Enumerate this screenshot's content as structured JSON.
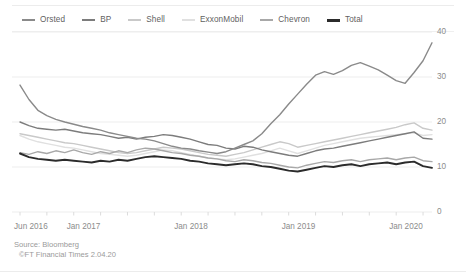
{
  "chart_data": {
    "type": "line",
    "title": "",
    "subtitle": "",
    "xlabel": "",
    "ylabel": "",
    "ylim": [
      0,
      40
    ],
    "yticks": [
      0,
      10,
      20,
      30,
      40
    ],
    "ytick_labels": [
      "0",
      "10",
      "20",
      "30",
      "40"
    ],
    "grid": true,
    "grid_axis": "y",
    "legend_position": "top-left",
    "x_start": "2016-06",
    "x_end": "2020-04",
    "x": [
      "Jun 2016",
      "Jul 2016",
      "Aug 2016",
      "Sep 2016",
      "Oct 2016",
      "Nov 2016",
      "Dec 2016",
      "Jan 2017",
      "Feb 2017",
      "Mar 2017",
      "Apr 2017",
      "May 2017",
      "Jun 2017",
      "Jul 2017",
      "Aug 2017",
      "Sep 2017",
      "Oct 2017",
      "Nov 2017",
      "Dec 2017",
      "Jan 2018",
      "Feb 2018",
      "Mar 2018",
      "Apr 2018",
      "May 2018",
      "Jun 2018",
      "Jul 2018",
      "Aug 2018",
      "Sep 2018",
      "Oct 2018",
      "Nov 2018",
      "Dec 2018",
      "Jan 2019",
      "Feb 2019",
      "Mar 2019",
      "Apr 2019",
      "May 2019",
      "Jun 2019",
      "Jul 2019",
      "Aug 2019",
      "Sep 2019",
      "Oct 2019",
      "Nov 2019",
      "Dec 2019",
      "Jan 2020",
      "Feb 2020",
      "Mar 2020",
      "Apr 2020"
    ],
    "xticks": [
      "Jun 2016",
      "Jan 2017",
      "Jan 2018",
      "Jan 2019",
      "Jan 2020"
    ],
    "xtick_labels": [
      "Jun 2016",
      "Jan 2017",
      "Jan 2018",
      "Jan 2019",
      "Jan 2020"
    ],
    "series": [
      {
        "name": "Orsted",
        "color": "#8a8a8a",
        "width": 1.4,
        "values": [
          28.2,
          25.0,
          22.6,
          21.4,
          20.6,
          20.0,
          19.5,
          19.0,
          18.6,
          18.2,
          17.6,
          17.2,
          16.8,
          16.4,
          16.2,
          15.8,
          15.2,
          14.6,
          14.2,
          14.0,
          13.6,
          13.3,
          13.0,
          13.4,
          14.2,
          15.0,
          15.8,
          17.4,
          19.6,
          21.6,
          24.0,
          26.2,
          28.4,
          30.4,
          31.2,
          30.6,
          31.4,
          32.6,
          33.2,
          32.4,
          31.6,
          30.4,
          29.2,
          28.6,
          31.0,
          33.6,
          37.6
        ]
      },
      {
        "name": "BP",
        "color": "#7c7c7c",
        "width": 1.4,
        "values": [
          20.0,
          19.2,
          18.6,
          18.4,
          18.2,
          18.4,
          18.0,
          17.6,
          17.4,
          17.2,
          16.8,
          16.4,
          16.6,
          16.2,
          16.6,
          16.8,
          17.2,
          17.0,
          16.6,
          16.2,
          15.6,
          15.0,
          14.8,
          14.2,
          14.0,
          14.6,
          14.4,
          13.8,
          13.4,
          13.0,
          12.6,
          12.4,
          13.0,
          13.6,
          14.0,
          14.2,
          14.6,
          15.0,
          15.4,
          15.8,
          16.2,
          16.6,
          17.0,
          17.4,
          17.8,
          16.4,
          16.2
        ]
      },
      {
        "name": "Shell",
        "color": "#c9c9c9",
        "width": 1.4,
        "values": [
          17.4,
          17.0,
          16.6,
          16.2,
          15.8,
          15.4,
          15.2,
          14.8,
          14.4,
          14.0,
          13.6,
          13.2,
          13.0,
          13.2,
          13.6,
          14.0,
          14.4,
          14.2,
          14.0,
          13.6,
          13.2,
          12.8,
          12.6,
          12.4,
          12.8,
          13.2,
          13.8,
          14.4,
          15.0,
          15.6,
          15.2,
          14.4,
          14.8,
          15.2,
          15.6,
          16.0,
          16.4,
          16.8,
          17.2,
          17.6,
          18.0,
          18.4,
          18.8,
          19.4,
          19.8,
          18.6,
          18.2
        ]
      },
      {
        "name": "ExxonMobil",
        "color": "#e0e0e0",
        "width": 1.4,
        "values": [
          17.0,
          16.2,
          15.6,
          15.2,
          14.8,
          14.4,
          14.2,
          13.8,
          13.4,
          13.0,
          12.8,
          12.6,
          12.4,
          12.6,
          13.0,
          13.4,
          13.8,
          13.6,
          13.2,
          12.8,
          12.4,
          12.0,
          11.8,
          11.6,
          11.8,
          12.2,
          12.6,
          13.0,
          13.6,
          14.2,
          13.6,
          13.0,
          13.6,
          14.2,
          14.8,
          15.2,
          15.6,
          16.0,
          16.4,
          16.6,
          16.8,
          17.0,
          17.2,
          17.4,
          17.6,
          17.0,
          17.2
        ]
      },
      {
        "name": "Chevron",
        "color": "#a8a8a8",
        "width": 1.4,
        "values": [
          13.2,
          12.8,
          13.4,
          13.0,
          13.6,
          13.2,
          13.8,
          13.2,
          12.8,
          13.4,
          13.0,
          13.6,
          13.2,
          13.8,
          14.2,
          14.0,
          13.6,
          13.2,
          13.0,
          12.6,
          12.4,
          12.0,
          11.8,
          11.4,
          11.2,
          11.6,
          11.4,
          11.0,
          10.8,
          10.4,
          10.0,
          9.8,
          10.4,
          10.8,
          11.2,
          11.0,
          11.4,
          11.6,
          11.2,
          11.6,
          11.8,
          12.0,
          11.6,
          12.0,
          12.2,
          11.4,
          11.2
        ]
      },
      {
        "name": "Total",
        "color": "#2b2b2b",
        "width": 1.9,
        "values": [
          13.0,
          12.2,
          11.8,
          11.6,
          11.4,
          11.6,
          11.4,
          11.2,
          11.0,
          11.4,
          11.2,
          11.6,
          11.4,
          11.8,
          12.2,
          12.4,
          12.2,
          12.0,
          11.8,
          11.4,
          11.2,
          10.8,
          10.6,
          10.4,
          10.6,
          10.8,
          10.6,
          10.2,
          10.0,
          9.6,
          9.2,
          9.0,
          9.4,
          9.8,
          10.2,
          10.0,
          10.4,
          10.6,
          10.2,
          10.6,
          10.8,
          11.0,
          10.6,
          11.0,
          11.2,
          10.2,
          9.8
        ]
      }
    ]
  },
  "legend": {
    "items": [
      {
        "label": "Orsted"
      },
      {
        "label": "BP"
      },
      {
        "label": "Shell"
      },
      {
        "label": "ExxonMobil"
      },
      {
        "label": "Chevron"
      },
      {
        "label": "Total"
      }
    ]
  },
  "footer": {
    "source": "Source: Bloomberg",
    "copyright": "©FT Financial Times 2.04.20"
  },
  "colors": {
    "grid": "#ededed",
    "axis_text": "#8c8c8c",
    "legend_text": "#5f5f5f",
    "footer_text": "#9a9a9a",
    "background": "#ffffff"
  }
}
